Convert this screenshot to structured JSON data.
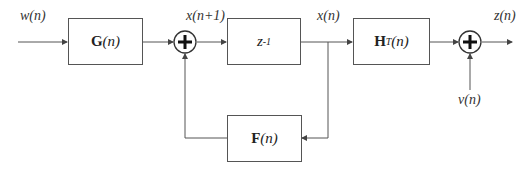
{
  "diagram": {
    "type": "block-diagram",
    "blocks": {
      "g": {
        "bold": "G",
        "arg": "(n)"
      },
      "delay": {
        "base": "z",
        "sup": "-1"
      },
      "h": {
        "bold": "H",
        "sup": "T",
        "arg": "(n)"
      },
      "f": {
        "bold": "F",
        "arg": "(n)"
      }
    },
    "signals": {
      "input": "w(n)",
      "state_next": "x(n+1)",
      "state": "x(n)",
      "output": "z(n)",
      "noise": "v(n)"
    },
    "summing_junctions": [
      "sum-1",
      "sum-2"
    ],
    "colors": {
      "line": "#444444",
      "background": "#ffffff"
    }
  }
}
